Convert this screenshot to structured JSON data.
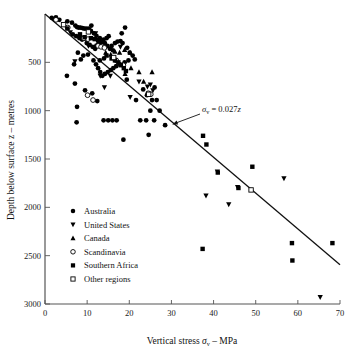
{
  "chart_data": {
    "type": "scatter",
    "title": "",
    "xlabel": "Vertical stress σv – MPa",
    "ylabel": "Depth below surface z – metres",
    "xlim": [
      0,
      70
    ],
    "ylim": [
      0,
      3000
    ],
    "y_inverted": true,
    "grid": false,
    "xticks": [
      0,
      10,
      20,
      30,
      40,
      50,
      60,
      70
    ],
    "xtick_labels": [
      "0",
      "10",
      "20",
      "30",
      "40",
      "50",
      "60",
      "70"
    ],
    "yticks": [
      500,
      1000,
      1500,
      2000,
      2500,
      3000
    ],
    "ytick_labels": [
      "500",
      "1000",
      "1500",
      "2000",
      "2500",
      "3000"
    ],
    "legend_position": "lower-left",
    "annotations": [
      {
        "text": "σv = 0.027z",
        "text_x": 32.5,
        "text_y": 980,
        "arrow_to_x": 30.3,
        "arrow_to_y": 1140
      }
    ],
    "trend_line": {
      "label": "σv = 0.027z",
      "equation": "sigma_v = 0.027 * z",
      "slope_MPa_per_m": 0.027,
      "points": [
        [
          0,
          0
        ],
        [
          70,
          2593
        ]
      ]
    },
    "series": [
      {
        "name": "Australia",
        "marker": "circle-filled",
        "color": "#000000",
        "points": [
          [
            1.6,
            40
          ],
          [
            2.2,
            55
          ],
          [
            2.6,
            35
          ],
          [
            3.4,
            60
          ],
          [
            5.3,
            75
          ],
          [
            6.4,
            90
          ],
          [
            7.2,
            120
          ],
          [
            7.6,
            135
          ],
          [
            8.0,
            140
          ],
          [
            8.4,
            140
          ],
          [
            8.9,
            145
          ],
          [
            9.3,
            150
          ],
          [
            9.8,
            150
          ],
          [
            10.4,
            150
          ],
          [
            11.0,
            120
          ],
          [
            6.6,
            210
          ],
          [
            7.4,
            230
          ],
          [
            8.2,
            250
          ],
          [
            8.8,
            265
          ],
          [
            9.4,
            255
          ],
          [
            9.9,
            300
          ],
          [
            10.6,
            320
          ],
          [
            11.3,
            340
          ],
          [
            11.9,
            360
          ],
          [
            12.4,
            330
          ],
          [
            12.9,
            300
          ],
          [
            13.4,
            285
          ],
          [
            13.0,
            250
          ],
          [
            12.2,
            225
          ],
          [
            11.6,
            200
          ],
          [
            10.9,
            175
          ],
          [
            13.9,
            265
          ],
          [
            14.6,
            250
          ],
          [
            15.1,
            230
          ],
          [
            14.2,
            300
          ],
          [
            14.8,
            330
          ],
          [
            15.4,
            360
          ],
          [
            16.1,
            375
          ],
          [
            15.8,
            330
          ],
          [
            16.6,
            300
          ],
          [
            17.2,
            285
          ],
          [
            17.9,
            280
          ],
          [
            18.4,
            300
          ],
          [
            19.0,
            140
          ],
          [
            18.2,
            200
          ],
          [
            19.5,
            350
          ],
          [
            20.1,
            400
          ],
          [
            20.8,
            430
          ],
          [
            21.3,
            470
          ],
          [
            19.8,
            480
          ],
          [
            18.9,
            500
          ],
          [
            17.8,
            520
          ],
          [
            16.9,
            540
          ],
          [
            16.2,
            560
          ],
          [
            15.6,
            580
          ],
          [
            14.9,
            600
          ],
          [
            14.2,
            620
          ],
          [
            13.6,
            640
          ],
          [
            13.1,
            600
          ],
          [
            12.6,
            560
          ],
          [
            12.1,
            520
          ],
          [
            11.5,
            480
          ],
          [
            5.2,
            640
          ],
          [
            7.1,
            720
          ],
          [
            7.6,
            960
          ],
          [
            7.5,
            1120
          ],
          [
            9.5,
            790
          ],
          [
            11.2,
            820
          ],
          [
            12.4,
            900
          ],
          [
            13.9,
            1100
          ],
          [
            15.0,
            1100
          ],
          [
            16.0,
            1100
          ],
          [
            17.0,
            1100
          ],
          [
            18.6,
            1300
          ],
          [
            19.4,
            680
          ],
          [
            21.6,
            890
          ],
          [
            22.6,
            1100
          ],
          [
            24.0,
            1100
          ],
          [
            24.6,
            1250
          ],
          [
            25.0,
            1000
          ],
          [
            25.4,
            890
          ],
          [
            25.9,
            1100
          ],
          [
            26.5,
            890
          ],
          [
            27.2,
            1000
          ],
          [
            28.5,
            1150
          ],
          [
            23.3,
            780
          ],
          [
            24.2,
            840
          ],
          [
            26.0,
            760
          ],
          [
            13.0,
            480
          ],
          [
            14.0,
            460
          ],
          [
            10.2,
            420
          ],
          [
            9.1,
            430
          ],
          [
            8.5,
            470
          ],
          [
            7.8,
            400
          ],
          [
            6.9,
            520
          ]
        ]
      },
      {
        "name": "United States",
        "marker": "triangle-down-filled",
        "color": "#000000",
        "points": [
          [
            6.0,
            190
          ],
          [
            7.1,
            490
          ],
          [
            10.3,
            330
          ],
          [
            12.0,
            200
          ],
          [
            13.1,
            640
          ],
          [
            14.1,
            760
          ],
          [
            15.5,
            640
          ],
          [
            17.9,
            340
          ],
          [
            20.2,
            860
          ],
          [
            22.3,
            700
          ],
          [
            24.3,
            750
          ],
          [
            25.0,
            730
          ],
          [
            25.6,
            790
          ],
          [
            38.2,
            1880
          ],
          [
            40.9,
            1630
          ],
          [
            43.6,
            1970
          ],
          [
            45.7,
            1790
          ],
          [
            56.7,
            1700
          ],
          [
            65.3,
            2930
          ]
        ]
      },
      {
        "name": "Canada",
        "marker": "triangle-up-filled",
        "color": "#000000",
        "points": [
          [
            8.6,
            240
          ],
          [
            11.9,
            330
          ],
          [
            14.4,
            400
          ],
          [
            15.6,
            420
          ],
          [
            16.6,
            390
          ],
          [
            17.7,
            400
          ],
          [
            18.9,
            370
          ],
          [
            20.2,
            400
          ],
          [
            22.3,
            600
          ],
          [
            25.4,
            600
          ],
          [
            20.4,
            560
          ],
          [
            19.0,
            620
          ],
          [
            23.4,
            700
          ],
          [
            12.6,
            290
          ]
        ]
      },
      {
        "name": "Scandinavia",
        "marker": "circle-open",
        "color": "#000000",
        "points": [
          [
            2.6,
            60
          ],
          [
            5.4,
            140
          ],
          [
            9.2,
            250
          ],
          [
            10.2,
            260
          ],
          [
            12.6,
            330
          ],
          [
            13.3,
            340
          ],
          [
            14.1,
            350
          ],
          [
            16.9,
            480
          ],
          [
            18.6,
            530
          ],
          [
            24.5,
            820
          ],
          [
            25.1,
            830
          ],
          [
            10.1,
            840
          ],
          [
            11.4,
            890
          ]
        ]
      },
      {
        "name": "Southern Africa",
        "marker": "square-filled",
        "color": "#000000",
        "points": [
          [
            5.3,
            150
          ],
          [
            8.3,
            210
          ],
          [
            9.4,
            240
          ],
          [
            10.9,
            250
          ],
          [
            11.8,
            260
          ],
          [
            12.6,
            270
          ],
          [
            13.4,
            290
          ],
          [
            14.6,
            430
          ],
          [
            15.8,
            460
          ],
          [
            16.6,
            480
          ],
          [
            17.4,
            500
          ],
          [
            18.0,
            530
          ],
          [
            18.7,
            560
          ],
          [
            19.2,
            590
          ],
          [
            37.5,
            1260
          ],
          [
            38.3,
            1350
          ],
          [
            41.0,
            1640
          ],
          [
            45.9,
            1800
          ],
          [
            49.2,
            1580
          ],
          [
            37.4,
            2430
          ],
          [
            58.6,
            2370
          ],
          [
            58.7,
            2550
          ],
          [
            68.2,
            2370
          ]
        ]
      },
      {
        "name": "Other regions",
        "marker": "square-open",
        "color": "#000000",
        "points": [
          [
            4.4,
            110
          ],
          [
            10.3,
            185
          ],
          [
            16.3,
            450
          ],
          [
            24.6,
            830
          ],
          [
            48.9,
            1820
          ]
        ]
      }
    ]
  },
  "legend": {
    "items": [
      {
        "label": "Australia",
        "marker": "circle-filled"
      },
      {
        "label": "United States",
        "marker": "triangle-down-filled"
      },
      {
        "label": "Canada",
        "marker": "triangle-up-filled"
      },
      {
        "label": "Scandinavia",
        "marker": "circle-open"
      },
      {
        "label": "Southern Africa",
        "marker": "square-filled"
      },
      {
        "label": "Other regions",
        "marker": "square-open"
      }
    ]
  },
  "axes": {
    "x_title_main": "Vertical stress",
    "x_title_symbol": "σ",
    "x_title_sub": "v",
    "x_title_unit": "– MPa",
    "y_title": "Depth below surface z – metres"
  },
  "annotation": {
    "symbol": "σ",
    "sub": "v",
    "rest": " = 0.027",
    "var": "z"
  },
  "colors": {
    "marker": "#000000",
    "axis": "#555555",
    "line": "#111111",
    "background": "#ffffff"
  }
}
